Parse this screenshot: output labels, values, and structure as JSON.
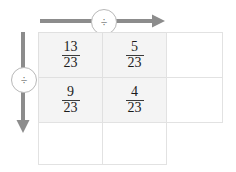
{
  "diagram": {
    "accent_color": "#8c8c8c",
    "shaded_cell_color": "#f4f4f4",
    "grid_line_color": "#e2e2e2"
  },
  "operators": {
    "top": {
      "symbol": "÷",
      "icon": "divide-icon",
      "direction": "right"
    },
    "left": {
      "symbol": "÷",
      "icon": "divide-icon",
      "direction": "down"
    }
  },
  "grid": {
    "columns": 3,
    "rows": 3,
    "cells": [
      [
        {
          "numerator": "13",
          "denominator": "23",
          "shaded": true
        },
        {
          "numerator": "5",
          "denominator": "23",
          "shaded": true
        },
        {
          "numerator": "",
          "denominator": "",
          "shaded": false
        }
      ],
      [
        {
          "numerator": "9",
          "denominator": "23",
          "shaded": true
        },
        {
          "numerator": "4",
          "denominator": "23",
          "shaded": true
        },
        {
          "numerator": "",
          "denominator": "",
          "shaded": false
        }
      ],
      [
        {
          "numerator": "",
          "denominator": "",
          "shaded": false
        },
        {
          "numerator": "",
          "denominator": "",
          "shaded": false
        }
      ]
    ]
  }
}
